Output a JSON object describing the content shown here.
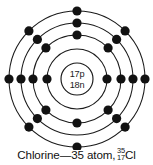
{
  "figure": {
    "type": "bohr-atom-diagram",
    "element_name": "Chlorine",
    "nucleus": {
      "protons_label": "17p",
      "neutrons_label": "18n",
      "protons": 17,
      "neutrons": 18
    },
    "shells": [
      {
        "name": "K",
        "index": 1,
        "electrons": 2
      },
      {
        "name": "L",
        "index": 2,
        "electrons": 8
      },
      {
        "name": "M",
        "index": 3,
        "electrons": 7
      },
      {
        "name": "outer-drawn",
        "index": 4,
        "electrons": 8
      }
    ],
    "colors": {
      "stroke": "#1a1a1a",
      "electron": "#121212",
      "background": "#ffffff",
      "text": "#111111"
    }
  },
  "caption": {
    "text": "Chlorine—35 atom,",
    "mass_number": "35",
    "atomic_number": "17",
    "symbol": "Cl"
  }
}
